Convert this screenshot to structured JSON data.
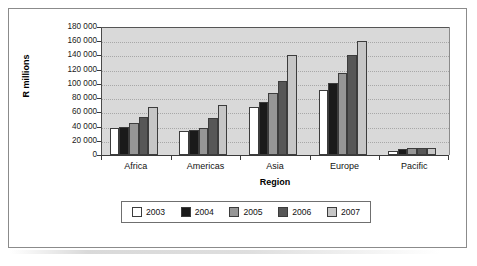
{
  "chart_data": {
    "type": "bar",
    "title": "",
    "xlabel": "Region",
    "ylabel": "R millions",
    "categories": [
      "Africa",
      "Americas",
      "Asia",
      "Europe",
      "Pacific"
    ],
    "ylim": [
      0,
      180000
    ],
    "ytick_step": 20000,
    "ytick_labels": [
      "180 000",
      "160 000",
      "140 000",
      "120 000",
      "100 000",
      "80 000",
      "60 000",
      "40 000",
      "20 000",
      "0"
    ],
    "ytick_values": [
      180000,
      160000,
      140000,
      120000,
      100000,
      80000,
      60000,
      40000,
      20000,
      0
    ],
    "grid": true,
    "legend_position": "bottom",
    "series": [
      {
        "name": "2003",
        "color": "#ffffff",
        "values": [
          38000,
          34000,
          67000,
          92000,
          6000
        ]
      },
      {
        "name": "2004",
        "color": "#1a1a1a",
        "values": [
          39500,
          35500,
          74000,
          101000,
          8500
        ]
      },
      {
        "name": "2005",
        "color": "#969696",
        "values": [
          45500,
          38500,
          87000,
          116000,
          10000
        ]
      },
      {
        "name": "2006",
        "color": "#575757",
        "values": [
          54000,
          52000,
          104000,
          140000,
          10000
        ]
      },
      {
        "name": "2007",
        "color": "#c6c6c6",
        "values": [
          68000,
          70000,
          140000,
          161000,
          10000
        ]
      }
    ]
  },
  "legend": {
    "entries": [
      {
        "label": "2003"
      },
      {
        "label": "2004"
      },
      {
        "label": "2005"
      },
      {
        "label": "2006"
      },
      {
        "label": "2007"
      }
    ]
  },
  "colors": {
    "plot_background": "#d9d9d9",
    "frame_border": "#8b8b8b",
    "axis": "#3a3a3a",
    "gridline": "#a8a8a8"
  }
}
